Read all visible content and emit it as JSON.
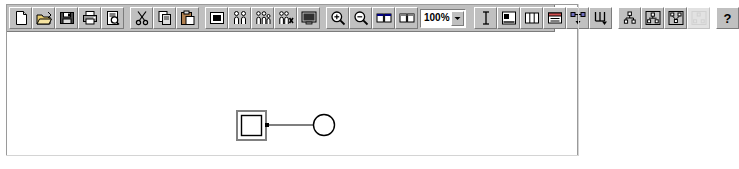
{
  "window": {
    "title": "Diagram Editor"
  },
  "toolbar": {
    "groups": [
      {
        "name": "file",
        "buttons": [
          {
            "id": "new",
            "icon": "new-document-icon",
            "label": "New",
            "enabled": true
          },
          {
            "id": "open",
            "icon": "open-folder-icon",
            "label": "Open",
            "enabled": true
          },
          {
            "id": "save",
            "icon": "save-diskette-icon",
            "label": "Save",
            "enabled": true
          },
          {
            "id": "print",
            "icon": "printer-icon",
            "label": "Print",
            "enabled": true
          },
          {
            "id": "preview",
            "icon": "print-preview-icon",
            "label": "Print Preview",
            "enabled": true
          }
        ]
      },
      {
        "name": "edit",
        "buttons": [
          {
            "id": "cut",
            "icon": "scissors-icon",
            "label": "Cut",
            "enabled": true
          },
          {
            "id": "copy",
            "icon": "copy-pages-icon",
            "label": "Copy",
            "enabled": true
          },
          {
            "id": "paste",
            "icon": "paste-clipboard-icon",
            "label": "Paste",
            "enabled": true
          }
        ]
      },
      {
        "name": "objects",
        "buttons": [
          {
            "id": "insert-object",
            "icon": "object-box-icon",
            "label": "Insert Object",
            "enabled": true
          },
          {
            "id": "add-pair",
            "icon": "two-people-icon",
            "label": "Add Pair",
            "enabled": true
          },
          {
            "id": "add-family",
            "icon": "people-group-icon",
            "label": "Add Family",
            "enabled": true
          },
          {
            "id": "remove-person",
            "icon": "person-delete-icon",
            "label": "Remove Person",
            "enabled": true
          },
          {
            "id": "display",
            "icon": "monitor-icon",
            "label": "Display",
            "enabled": true
          }
        ]
      },
      {
        "name": "view",
        "buttons": [
          {
            "id": "zoom-in",
            "icon": "zoom-in-icon",
            "label": "Zoom In",
            "enabled": true
          },
          {
            "id": "zoom-out",
            "icon": "zoom-out-icon",
            "label": "Zoom Out",
            "enabled": true
          },
          {
            "id": "tile-horiz",
            "icon": "tile-horizontal-icon",
            "label": "Tile Horizontally",
            "enabled": true
          },
          {
            "id": "tile-vert",
            "icon": "tile-vertical-icon",
            "label": "Tile Vertically",
            "enabled": true
          }
        ]
      },
      {
        "name": "format",
        "buttons": [
          {
            "id": "text-tool",
            "icon": "text-cursor-icon",
            "label": "Text",
            "enabled": true
          },
          {
            "id": "align",
            "icon": "align-object-icon",
            "label": "Align",
            "enabled": true
          },
          {
            "id": "columns",
            "icon": "columns-icon",
            "label": "Columns",
            "enabled": true
          },
          {
            "id": "card-view",
            "icon": "card-view-icon",
            "label": "Card View",
            "enabled": true
          },
          {
            "id": "link-nodes",
            "icon": "link-nodes-icon",
            "label": "Link Nodes",
            "enabled": true
          },
          {
            "id": "descend",
            "icon": "descend-arrow-icon",
            "label": "Descend",
            "enabled": true
          }
        ]
      },
      {
        "name": "hierarchy",
        "buttons": [
          {
            "id": "tree-small",
            "icon": "tree-small-icon",
            "label": "Small Tree",
            "enabled": true
          },
          {
            "id": "tree-family",
            "icon": "tree-family-icon",
            "label": "Family Tree",
            "enabled": true
          },
          {
            "id": "tree-network",
            "icon": "tree-network-icon",
            "label": "Network Tree",
            "enabled": true
          },
          {
            "id": "tree-extra",
            "icon": "tree-extra-icon",
            "label": "Extended Tree",
            "enabled": false
          }
        ]
      },
      {
        "name": "help",
        "buttons": [
          {
            "id": "help",
            "icon": "question-mark-icon",
            "label": "Help",
            "enabled": true
          }
        ]
      }
    ],
    "zoom": {
      "value": "100%",
      "options": [
        "25%",
        "50%",
        "75%",
        "100%",
        "150%",
        "200%",
        "400%"
      ],
      "arrow_glyph": "▼"
    }
  },
  "canvas": {
    "background_color": "#ffffff",
    "shapes": [
      {
        "id": "node-square",
        "type": "square",
        "selected": true,
        "x": 237,
        "y": 109,
        "size": 24,
        "stroke": "#000000",
        "fill": "#ffffff",
        "selection_color": "#808080"
      },
      {
        "id": "node-circle",
        "type": "circle",
        "selected": false,
        "cx": 317,
        "cy": 121,
        "r": 11,
        "stroke": "#000000",
        "fill": "#ffffff"
      }
    ],
    "connectors": [
      {
        "id": "connector-1",
        "from": "node-square",
        "to": "node-circle",
        "x1": 262,
        "y1": 121,
        "x2": 306,
        "y2": 121,
        "stroke": "#000000"
      }
    ]
  },
  "colors": {
    "toolbar_face": "#c0c0c0",
    "toolbar_shadow": "#7c7c7c",
    "toolbar_highlight": "#ffffff",
    "window_border": "#9a9a9a",
    "canvas": "#ffffff",
    "ink": "#000000"
  }
}
